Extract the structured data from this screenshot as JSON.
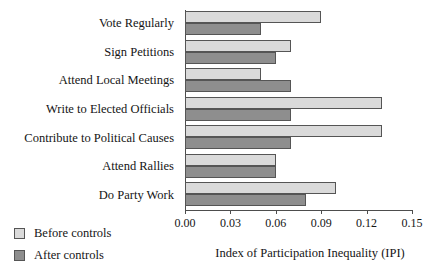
{
  "chart_data": {
    "type": "bar",
    "orientation": "horizontal",
    "title": "",
    "xlabel": "Index of Participation Inequality (IPI)",
    "ylabel": "",
    "xlim": [
      0.0,
      0.15
    ],
    "xticks": [
      "0.00",
      "0.03",
      "0.06",
      "0.09",
      "0.12",
      "0.15"
    ],
    "xtick_values": [
      0.0,
      0.03,
      0.06,
      0.09,
      0.12,
      0.15
    ],
    "grid": false,
    "legend_position": "lower-left",
    "categories": [
      "Vote Regularly",
      "Sign Petitions",
      "Attend Local Meetings",
      "Write to Elected Officials",
      "Contribute to Political Causes",
      "Attend Rallies",
      "Do Party Work"
    ],
    "series": [
      {
        "name": "Before controls",
        "color": "#dadada",
        "values": [
          0.09,
          0.07,
          0.05,
          0.13,
          0.13,
          0.06,
          0.1
        ]
      },
      {
        "name": "After controls",
        "color": "#8e8e8e",
        "values": [
          0.05,
          0.06,
          0.07,
          0.07,
          0.07,
          0.06,
          0.08
        ]
      }
    ]
  },
  "legend": {
    "items": [
      {
        "label": "Before controls",
        "color": "#dadada"
      },
      {
        "label": "After controls",
        "color": "#8e8e8e"
      }
    ]
  },
  "axis": {
    "x_title": "Index of Participation Inequality (IPI)",
    "line_color": "#4d4d4d"
  }
}
